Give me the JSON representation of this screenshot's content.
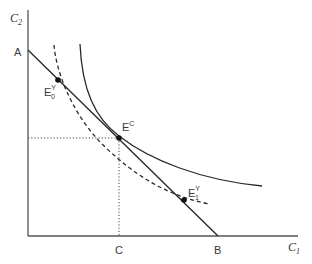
{
  "diagram": {
    "title": "",
    "axes": {
      "y_label": "C",
      "y_label_sub": "2",
      "x_label": "C",
      "x_label_sub": "1"
    },
    "points": {
      "A": {
        "label": "A"
      },
      "B": {
        "label": "B"
      },
      "C": {
        "label": "C"
      },
      "E0": {
        "label": "E",
        "sub": "0",
        "sup": "Y"
      },
      "EC": {
        "label": "E",
        "sup": "C"
      },
      "E1": {
        "label": "E",
        "sub": "1",
        "sup": "Y"
      }
    },
    "curves": {
      "budget_line": "straight line from A to B",
      "indifference_solid": "solid convex curve tangent at E^C",
      "indifference_dashed": "dashed convex curve through E0^Y and E1^Y"
    },
    "colors": {
      "line": "#2a2a2a",
      "text": "#3a3a3a",
      "background": "#ffffff"
    }
  }
}
